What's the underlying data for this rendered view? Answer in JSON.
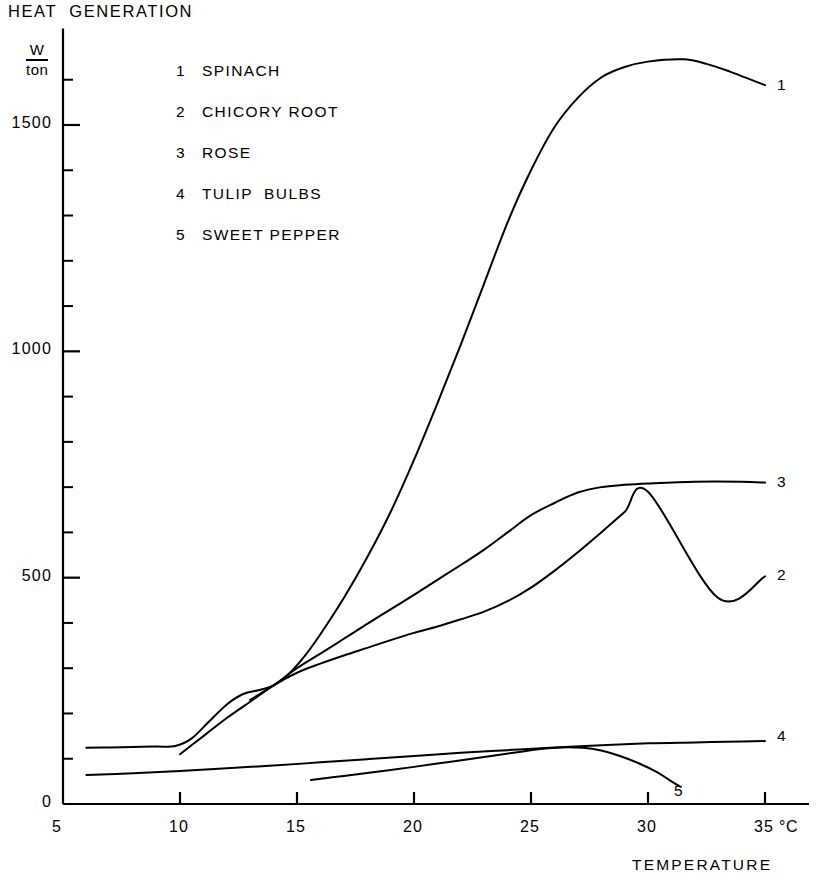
{
  "chart_data": {
    "type": "line",
    "title": "HEAT  GENERATION",
    "xlabel": "TEMPERATURE",
    "x_unit": "°C",
    "ylabel": "W / ton",
    "y_unit_numerator": "W",
    "y_unit_denominator": "ton",
    "xlim": [
      5,
      35
    ],
    "ylim": [
      0,
      1700
    ],
    "x_ticks": [
      5,
      10,
      15,
      20,
      25,
      30,
      35
    ],
    "x_tick_labels": [
      "5",
      "10",
      "15",
      "20",
      "25",
      "30",
      "35"
    ],
    "x_minor_step": 5,
    "y_ticks": [
      0,
      500,
      1000,
      1500
    ],
    "y_tick_labels": [
      "0",
      "500",
      "1000",
      "1500"
    ],
    "y_minor_step": 100,
    "grid": false,
    "legend_position": "upper-left-inside",
    "series": [
      {
        "key": "1",
        "name": "SPINACH",
        "end_label": "1",
        "points": [
          [
            6.0,
            124
          ],
          [
            7.0,
            125
          ],
          [
            8.0,
            126
          ],
          [
            9.0,
            127
          ],
          [
            9.8,
            128
          ],
          [
            10.5,
            145
          ],
          [
            11.2,
            180
          ],
          [
            12.0,
            220
          ],
          [
            12.7,
            243
          ],
          [
            13.4,
            252
          ],
          [
            14.0,
            262
          ],
          [
            14.6,
            285
          ],
          [
            15.3,
            325
          ],
          [
            16.0,
            375
          ],
          [
            17.0,
            455
          ],
          [
            18.0,
            545
          ],
          [
            19.0,
            645
          ],
          [
            20.0,
            760
          ],
          [
            21.0,
            885
          ],
          [
            22.0,
            1015
          ],
          [
            23.0,
            1150
          ],
          [
            24.0,
            1285
          ],
          [
            25.0,
            1400
          ],
          [
            26.0,
            1495
          ],
          [
            27.0,
            1560
          ],
          [
            28.0,
            1605
          ],
          [
            29.0,
            1628
          ],
          [
            30.0,
            1640
          ],
          [
            31.5,
            1645
          ],
          [
            32.5,
            1635
          ],
          [
            33.5,
            1618
          ],
          [
            34.5,
            1598
          ],
          [
            35.0,
            1588
          ]
        ]
      },
      {
        "key": "2",
        "name": "CHICORY ROOT",
        "end_label": "2",
        "points": [
          [
            10.0,
            110
          ],
          [
            11.0,
            150
          ],
          [
            12.0,
            190
          ],
          [
            13.0,
            226
          ],
          [
            14.0,
            262
          ],
          [
            15.0,
            290
          ],
          [
            16.0,
            310
          ],
          [
            17.0,
            328
          ],
          [
            18.0,
            345
          ],
          [
            19.0,
            362
          ],
          [
            20.0,
            378
          ],
          [
            21.0,
            392
          ],
          [
            22.0,
            408
          ],
          [
            23.0,
            425
          ],
          [
            24.0,
            448
          ],
          [
            25.0,
            478
          ],
          [
            26.0,
            515
          ],
          [
            27.0,
            556
          ],
          [
            28.0,
            600
          ],
          [
            29.0,
            645
          ],
          [
            30.0,
            690
          ],
          [
            31.0,
            738
          ],
          [
            32.0,
            790
          ],
          [
            33.0,
            845
          ],
          [
            34.0,
            905
          ],
          [
            35.0,
            503
          ]
        ]
      },
      {
        "key": "3",
        "name": "ROSE",
        "end_label": "3",
        "points": [
          [
            13.0,
            230
          ],
          [
            14.0,
            262
          ],
          [
            15.0,
            300
          ],
          [
            16.0,
            332
          ],
          [
            17.0,
            365
          ],
          [
            18.0,
            398
          ],
          [
            19.0,
            430
          ],
          [
            20.0,
            462
          ],
          [
            21.0,
            495
          ],
          [
            22.0,
            528
          ],
          [
            23.0,
            562
          ],
          [
            24.0,
            600
          ],
          [
            25.0,
            638
          ],
          [
            26.0,
            665
          ],
          [
            27.0,
            688
          ],
          [
            28.0,
            700
          ],
          [
            29.0,
            705
          ],
          [
            30.0,
            708
          ],
          [
            32.0,
            712
          ],
          [
            34.0,
            712
          ],
          [
            35.0,
            710
          ]
        ]
      },
      {
        "key": "4",
        "name": "TULIP  BULBS",
        "end_label": "4",
        "points": [
          [
            6.0,
            64
          ],
          [
            8.0,
            68
          ],
          [
            10.0,
            73
          ],
          [
            12.0,
            79
          ],
          [
            14.0,
            85
          ],
          [
            16.0,
            92
          ],
          [
            18.0,
            99
          ],
          [
            20.0,
            106
          ],
          [
            22.0,
            113
          ],
          [
            24.0,
            119
          ],
          [
            26.0,
            125
          ],
          [
            28.0,
            130
          ],
          [
            30.0,
            134
          ],
          [
            32.0,
            136
          ],
          [
            34.0,
            138
          ],
          [
            35.0,
            139
          ]
        ]
      },
      {
        "key": "5",
        "name": "SWEET PEPPER",
        "end_label": "5",
        "points": [
          [
            15.6,
            53
          ],
          [
            17.0,
            62
          ],
          [
            18.5,
            72
          ],
          [
            20.0,
            82
          ],
          [
            21.5,
            93
          ],
          [
            23.0,
            104
          ],
          [
            24.5,
            115
          ],
          [
            25.5,
            122
          ],
          [
            26.3,
            125
          ],
          [
            27.2,
            124
          ],
          [
            28.0,
            118
          ],
          [
            28.8,
            106
          ],
          [
            29.6,
            90
          ],
          [
            30.4,
            70
          ],
          [
            31.0,
            50
          ],
          [
            31.4,
            38
          ]
        ]
      }
    ]
  },
  "axes": {
    "x_caption": "TEMPERATURE",
    "x_unit_label": "°C"
  }
}
